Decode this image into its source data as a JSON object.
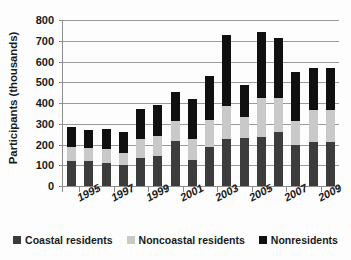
{
  "chart_data": {
    "type": "bar",
    "subtype": "stacked-vertical",
    "title": "",
    "subtitle": "",
    "xlabel": "",
    "ylabel": "Participants (thousands)",
    "ylim": [
      0,
      800
    ],
    "ytick_values": [
      0,
      100,
      200,
      300,
      400,
      500,
      600,
      700,
      800
    ],
    "ytick_labels": [
      "0",
      "100",
      "200",
      "300",
      "400",
      "500",
      "600",
      "700",
      "800"
    ],
    "grid": true,
    "grid_axis": "y",
    "legend_position": "bottom",
    "x": [
      1994,
      1995,
      1996,
      1997,
      1998,
      1999,
      2000,
      2001,
      2002,
      2003,
      2004,
      2005,
      2006,
      2007,
      2008,
      2009
    ],
    "categories": [
      "1994",
      "1995",
      "1996",
      "1997",
      "1998",
      "1999",
      "2000",
      "2001",
      "2002",
      "2003",
      "2004",
      "2005",
      "2006",
      "2007",
      "2008",
      "2009"
    ],
    "xtick_labels_shown": [
      "1995",
      "1997",
      "1999",
      "2001",
      "2003",
      "2005",
      "2007",
      "2009"
    ],
    "xtick_label_rotation": -28,
    "series": [
      {
        "name": "Coastal residents",
        "color": "#3c3c3c",
        "values": [
          120,
          122,
          110,
          103,
          133,
          144,
          216,
          127,
          190,
          226,
          229,
          236,
          258,
          197,
          211,
          211
        ]
      },
      {
        "name": "Noncoastal residents",
        "color": "#c9c9c9",
        "values": [
          67,
          63,
          70,
          57,
          93,
          95,
          95,
          99,
          126,
          160,
          102,
          186,
          167,
          118,
          157,
          157
        ]
      },
      {
        "name": "Nonresidents",
        "color": "#101010",
        "values": [
          99,
          87,
          93,
          98,
          143,
          150,
          143,
          191,
          212,
          344,
          158,
          318,
          290,
          236,
          202,
          202
        ]
      }
    ],
    "totals": [
      286,
      272,
      273,
      258,
      369,
      389,
      454,
      417,
      528,
      730,
      489,
      740,
      715,
      551,
      570,
      570
    ]
  },
  "legend": {
    "items": [
      {
        "label": "Coastal residents",
        "color": "#3c3c3c",
        "swatch": "square-marker-icon"
      },
      {
        "label": "Noncoastal residents",
        "color": "#c9c9c9",
        "swatch": "square-marker-icon"
      },
      {
        "label": "Nonresidents",
        "color": "#101010",
        "swatch": "square-marker-icon"
      }
    ]
  },
  "axes": {
    "y_title": "Participants (thousands)"
  }
}
